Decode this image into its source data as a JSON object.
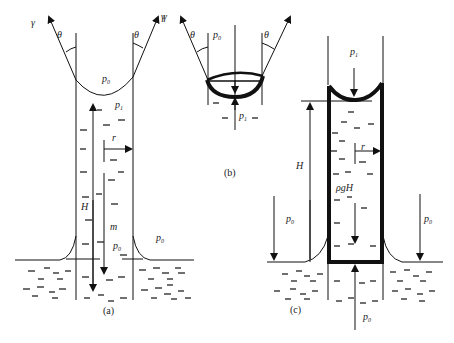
{
  "figure": {
    "panels": [
      {
        "id": "a",
        "caption": "(a)",
        "labels": {
          "gamma_left": "γ",
          "gamma_right": "γ",
          "theta_left": "θ",
          "theta_right": "θ",
          "p0_top": "p",
          "p0_top_sub": "0",
          "p1": "p",
          "p1_sub": "1",
          "r": "r",
          "H": "H",
          "m": "m",
          "p0_inner": "p",
          "p0_inner_sub": "0",
          "p0_outer": "p",
          "p0_outer_sub": "0"
        }
      },
      {
        "id": "b",
        "caption": "(b)",
        "labels": {
          "gamma_left": "γ",
          "theta_left": "θ",
          "theta_right": "θ",
          "p0": "p",
          "p0_sub": "0",
          "p1": "p",
          "p1_sub": "1"
        }
      },
      {
        "id": "c",
        "caption": "(c)",
        "labels": {
          "p1": "p",
          "p1_sub": "1",
          "H": "H",
          "r": "r",
          "rhogH": "ρgH",
          "p0_left": "p",
          "p0_left_sub": "0",
          "p0_right": "p",
          "p0_right_sub": "0",
          "p0_bottom": "p",
          "p0_bottom_sub": "0"
        }
      }
    ]
  }
}
